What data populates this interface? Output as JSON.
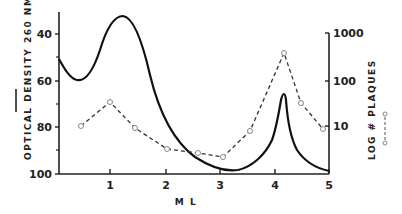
{
  "chart_data": {
    "type": "line",
    "title": "",
    "xlabel": "ML",
    "ylabel_left": "OPTICAL DENSITY 260 NM",
    "ylabel_right": "LOG # PLAQUES",
    "xlim": [
      0,
      5
    ],
    "ylim_left": [
      100,
      30
    ],
    "ylim_right_log": [
      1,
      1000
    ],
    "x_ticks": [
      "1",
      "2",
      "3",
      "4",
      "5"
    ],
    "y_left_ticks": [
      "40",
      "60",
      "80",
      "100"
    ],
    "y_right_ticks": [
      "10",
      "100",
      "1000"
    ],
    "grid": false,
    "series": [
      {
        "name": "Optical density 260 nm",
        "axis": "left",
        "style": "solid",
        "x": [
          0.0,
          0.15,
          0.3,
          0.5,
          0.75,
          1.0,
          1.2,
          1.4,
          1.6,
          1.8,
          2.0,
          2.2,
          2.5,
          2.8,
          3.0,
          3.3,
          3.6,
          3.8,
          3.95,
          4.05,
          4.12,
          4.18,
          4.25,
          4.4,
          4.6,
          4.8,
          5.0
        ],
        "values": [
          52,
          58,
          59,
          56,
          45,
          36,
          33,
          36,
          50,
          70,
          82,
          89,
          95,
          98,
          99,
          97,
          93,
          89,
          83,
          75,
          67,
          72,
          85,
          92,
          96,
          98,
          99
        ]
      },
      {
        "name": "Log # plaques",
        "axis": "right",
        "style": "dashed",
        "marker": "open-circle",
        "x": [
          0.4,
          0.95,
          1.4,
          2.0,
          2.55,
          3.05,
          3.55,
          4.15,
          4.5,
          4.9
        ],
        "values": [
          10,
          30,
          9,
          3,
          2.5,
          2,
          8,
          350,
          30,
          9
        ]
      }
    ]
  },
  "axes": {
    "left_ticks": [
      {
        "label": "40",
        "y": 34
      },
      {
        "label": "60",
        "y": 81
      },
      {
        "label": "80",
        "y": 127
      },
      {
        "label": "100",
        "y": 174
      }
    ],
    "right_ticks": [
      {
        "label": "1000",
        "y": 33
      },
      {
        "label": "100",
        "y": 81
      },
      {
        "label": "10",
        "y": 126
      }
    ],
    "x_ticks": [
      {
        "label": "1",
        "x": 110
      },
      {
        "label": "2",
        "x": 166
      },
      {
        "label": "3",
        "x": 220
      },
      {
        "label": "4",
        "x": 275
      },
      {
        "label": "5",
        "x": 329
      }
    ],
    "xlabel": "M L",
    "ylabel_left": "OPTICAL DENSITY 260 NM",
    "ylabel_right": "LOG # PLAQUES"
  }
}
